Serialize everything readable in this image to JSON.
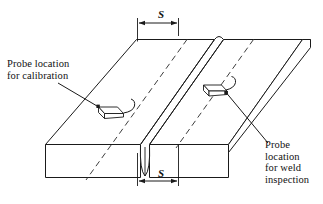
{
  "figure": {
    "title_alt": "Ultrasonic probe locations on a welded plate",
    "background_color": "#ffffff",
    "line_color": "#1a1a1a",
    "dashed_color": "#4d4d4d"
  },
  "labels": {
    "calibration": {
      "line1": "Probe location",
      "line2": "for calibration"
    },
    "weld": {
      "line1": "Probe",
      "line2": "location",
      "line3": "for weld",
      "line4": "inspection"
    }
  },
  "dimensions": {
    "top_symbol": "S",
    "bottom_symbol": "S"
  },
  "parts": {
    "plate": "steel-plate",
    "weld_bead": "weld-bead",
    "probe_left": "probe-calibration",
    "probe_right": "probe-weld-inspection",
    "skip_line_left": "dashed-skip-distance-left",
    "skip_line_right": "dashed-skip-distance-right"
  }
}
